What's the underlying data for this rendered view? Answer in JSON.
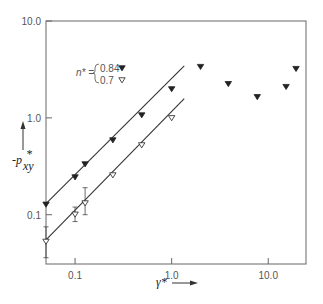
{
  "chart_data": {
    "type": "scatter",
    "title": "",
    "xlabel": "γ*",
    "ylabel": "-p*xy",
    "xscale": "log",
    "yscale": "log",
    "xlim": [
      0.05,
      24.6
    ],
    "ylim": [
      0.031,
      10.0
    ],
    "x_ticks": [
      0.1,
      1.0,
      10.0
    ],
    "x_tick_labels": [
      "0.1",
      "1.0",
      "10.0"
    ],
    "y_ticks": [
      0.1,
      1.0,
      10.0
    ],
    "y_tick_labels": [
      "0.1",
      "1.0",
      "10.0"
    ],
    "grid": false,
    "legend": {
      "prefix": "n* =",
      "position": "upper-left",
      "entries": [
        {
          "label": "0.84",
          "marker": "filled-down-triangle"
        },
        {
          "label": "0.7",
          "marker": "open-down-triangle"
        }
      ]
    },
    "series": [
      {
        "name": "n* = 0.84",
        "marker": "filled-down-triangle",
        "x": [
          0.05,
          0.1,
          0.127,
          0.246,
          0.49,
          1.0,
          1.99,
          3.86,
          7.7,
          15.3,
          19.4
        ],
        "y": [
          0.128,
          0.245,
          0.334,
          0.59,
          1.07,
          1.99,
          3.38,
          2.25,
          1.65,
          2.1,
          3.22
        ],
        "fit_line": {
          "x": [
            0.05,
            1.35
          ],
          "y": [
            0.13,
            3.45
          ]
        }
      },
      {
        "name": "n* = 0.7",
        "marker": "open-down-triangle",
        "x": [
          0.05,
          0.1,
          0.127,
          0.246,
          0.49,
          1.0
        ],
        "y": [
          0.053,
          0.101,
          0.132,
          0.257,
          0.525,
          1.0
        ],
        "error_bars": [
          [
            0.036,
            0.075
          ],
          [
            0.085,
            0.12
          ],
          [
            0.1,
            0.19
          ],
          null,
          null,
          null
        ],
        "fit_line": {
          "x": [
            0.05,
            1.35
          ],
          "y": [
            0.055,
            1.58
          ]
        }
      }
    ]
  }
}
